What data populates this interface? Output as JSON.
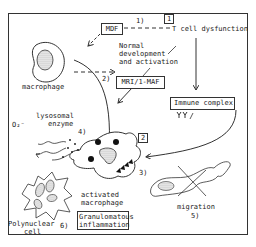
{
  "diagram": {
    "boxes": {
      "mdf": "MDF",
      "mri_maf": "MRI/1-MAF",
      "immune_complex": "Immune complex",
      "granulomatous": [
        "Granulomatous",
        "inflammation"
      ]
    },
    "markers": {
      "one": "1",
      "two": "2"
    },
    "labels": {
      "t_cell": "T cell dysfunction",
      "step1": "1)",
      "step2": "2)",
      "step3": "3)",
      "step4": "4)",
      "step5": "5)",
      "step6": "6)",
      "normal_dev": [
        "Normal",
        "development",
        "and activation"
      ],
      "macrophage": "macrophage",
      "lysosomal": [
        "lysosomal",
        "enzyme"
      ],
      "o2": "O₂⁻",
      "activated": [
        "activated",
        "macrophage"
      ],
      "polynuclear": [
        "Polynuclear",
        "cell"
      ],
      "migration": "migration"
    }
  }
}
